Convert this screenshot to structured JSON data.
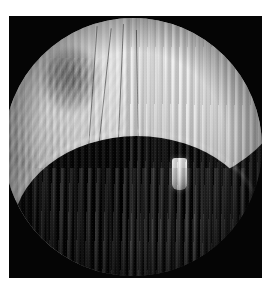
{
  "image": {
    "kind": "endoscopic-photograph",
    "modality_label": "endoscopy",
    "color_mode": "grayscale",
    "border": {
      "color": "#ffffff",
      "left_px": 9,
      "top_px": 16,
      "right_px": 8,
      "bottom_px": 12
    },
    "background": {
      "color": "#050505",
      "description": "black rectangular frame surrounding circular field of view"
    },
    "field_of_view": {
      "shape": "circle",
      "diameter_px": 258,
      "center_x_px": 124,
      "center_y_px": 147
    },
    "regions": [
      {
        "name": "upper-dome",
        "label": "bright mucosal dome",
        "tone": "#ebebeb",
        "description": "large bright convex structure filling the upper two thirds with fine vertical striations"
      },
      {
        "name": "dark-blotch",
        "label": "dark patch",
        "tone": "#5a5a5a",
        "description": "soft darker blotch on the upper-left of the dome"
      },
      {
        "name": "arch-cavity",
        "label": "dark cavity",
        "tone": "#060606",
        "description": "concave dark arch beneath the dome opening into the cavity"
      },
      {
        "name": "pendant-object",
        "label": "bright pendulous body",
        "tone": "#f0f0f0",
        "description": "small vertical bright rectangular body hanging from the arch edge, right of centre"
      },
      {
        "name": "lower-left-crescent",
        "label": "lower bright fold",
        "tone": "#9e9e9e",
        "description": "mid-grey crescent of tissue entering from the lower left"
      },
      {
        "name": "lower-floor",
        "label": "textured floor",
        "tone": "#2b2b2b",
        "description": "dim textured floor across the bottom with vertical banding"
      }
    ],
    "artifacts": [
      {
        "name": "moire-banding",
        "label": "vertical interference banding",
        "description": "regular vertical light and dark bands across the whole frame"
      },
      {
        "name": "hairline-cracks",
        "label": "fine dark linear striations",
        "description": "four near-vertical dark hairlines crossing the centre of the dome"
      },
      {
        "name": "vignette",
        "label": "rim vignetting",
        "description": "brightness falls off toward the circular rim"
      },
      {
        "name": "sensor-grain",
        "label": "image grain",
        "description": "fine granular noise over the darker areas"
      }
    ],
    "palette": {
      "white_border": "#ffffff",
      "frame_black": "#050505",
      "highlight": "#f4f4f4",
      "mid_grey": "#9e9e9e",
      "shadow_grey": "#2b2b2b",
      "deep_black": "#000000"
    }
  }
}
